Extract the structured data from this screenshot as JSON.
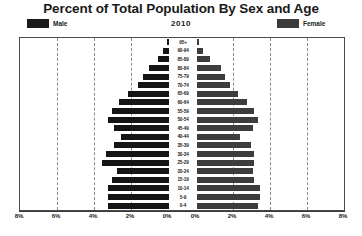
{
  "chart_data": {
    "type": "bar",
    "subtype": "population-pyramid",
    "title": "Percent of Total Population By Sex and Age",
    "subtitle": "2010",
    "xlabel": "",
    "ylabel": "",
    "xlim": [
      -8,
      8
    ],
    "xticks": [
      "8%",
      "6%",
      "4%",
      "2%",
      "0%",
      "0%",
      "2%",
      "4%",
      "6%",
      "8%"
    ],
    "xtick_values": [
      -8,
      -6,
      -4,
      -2,
      0,
      0,
      2,
      4,
      6,
      8
    ],
    "grid": true,
    "grid_style": "dashed-vertical",
    "legend_position": "top",
    "categories": [
      "95+",
      "90-94",
      "85-89",
      "80-84",
      "75-79",
      "70-74",
      "65-69",
      "60-64",
      "55-59",
      "50-54",
      "45-49",
      "40-44",
      "35-39",
      "30-34",
      "25-29",
      "20-24",
      "15-19",
      "10-14",
      "5-9",
      "0-4"
    ],
    "series": [
      {
        "name": "Male",
        "color": "#151515",
        "direction": "left",
        "values": [
          0.1,
          0.3,
          0.6,
          1.1,
          1.4,
          1.7,
          2.2,
          2.7,
          3.1,
          3.3,
          3.0,
          2.6,
          3.0,
          3.4,
          3.6,
          2.8,
          3.1,
          3.3,
          3.3,
          3.3
        ]
      },
      {
        "name": "Female",
        "color": "#3d3d3d",
        "direction": "right",
        "values": [
          0.1,
          0.3,
          0.7,
          1.3,
          1.5,
          1.8,
          2.2,
          2.7,
          3.1,
          3.3,
          3.0,
          2.3,
          2.9,
          3.1,
          3.1,
          3.0,
          3.1,
          3.4,
          3.4,
          3.3
        ]
      }
    ]
  },
  "legend": {
    "male_label": "Male",
    "female_label": "Female"
  }
}
